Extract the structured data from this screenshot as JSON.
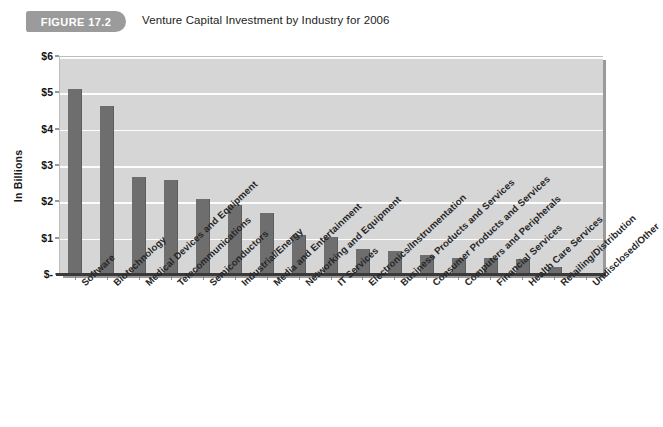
{
  "figure": {
    "badge_label": "FIGURE 17.2",
    "title": "Venture Capital Investment by Industry for 2006"
  },
  "colors": {
    "bar": "#6e6e6e",
    "plot_background": "#d6d6d6",
    "gridline": "#fdfdfd",
    "badge": "#9b9b9b",
    "axis": "#3a3a3a"
  },
  "chart_data": {
    "type": "bar",
    "title": "Venture Capital Investment by Industry for 2006",
    "xlabel": "",
    "ylabel": "In Billions",
    "ylim": [
      0,
      6
    ],
    "ytick_labels": [
      "$-",
      "$1",
      "$2",
      "$3",
      "$4",
      "$5",
      "$6"
    ],
    "ytick_values": [
      0,
      1,
      2,
      3,
      4,
      5,
      6
    ],
    "grid": true,
    "legend": false,
    "categories": [
      "Software",
      "Biotechnology",
      "Medical Devices and Equipment",
      "Telecommunications",
      "Semiconductors",
      "Industrial/Energy",
      "Media and Entertainment",
      "Networking and Equipment",
      "IT Services",
      "Electronics/Instrumentation",
      "Business Products and Services",
      "Consumer Products and Services",
      "Computers and Peripherals",
      "Financial Services",
      "Health Care Services",
      "Retailing/Distribution",
      "Undisclosed/Other"
    ],
    "values": [
      5.1,
      4.62,
      2.67,
      2.6,
      2.07,
      1.9,
      1.68,
      1.08,
      1.03,
      0.68,
      0.62,
      0.52,
      0.45,
      0.44,
      0.42,
      0.2,
      0.02
    ]
  }
}
